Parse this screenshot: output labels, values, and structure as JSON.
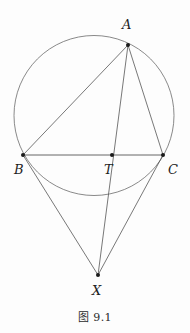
{
  "figure": {
    "caption": "图 9.1",
    "caption_number": "9.1",
    "background_color": "#fdfdfd",
    "stroke_color": "#555555",
    "vertex_color": "#1a1a1a",
    "label_color": "#1d1d1d",
    "stroke_width": 0.8,
    "vertex_radius": 2.0
  },
  "geometry": {
    "circle": {
      "name": "circumcircle",
      "cx": 94,
      "cy": 115.5,
      "r": 80,
      "stroke": "#6b6b6b"
    },
    "points": [
      {
        "id": "A",
        "label": "A",
        "x": 128,
        "y": 45,
        "label_x": 122,
        "label_y": 18
      },
      {
        "id": "B",
        "label": "B",
        "x": 23,
        "y": 155,
        "label_x": 14,
        "label_y": 163
      },
      {
        "id": "C",
        "label": "C",
        "x": 163,
        "y": 155,
        "label_x": 168,
        "label_y": 163
      },
      {
        "id": "T",
        "label": "T",
        "x": 112,
        "y": 155,
        "label_x": 104,
        "label_y": 163
      },
      {
        "id": "X",
        "label": "X",
        "x": 98,
        "y": 275,
        "label_x": 92,
        "label_y": 284
      }
    ],
    "segments": [
      {
        "id": "AB",
        "from": "A",
        "to": "B"
      },
      {
        "id": "AC",
        "from": "A",
        "to": "C"
      },
      {
        "id": "AX",
        "from": "A",
        "to": "X",
        "note": "passes through T"
      },
      {
        "id": "BC",
        "from": "B",
        "to": "C",
        "note": "passes through T"
      },
      {
        "id": "BX",
        "from": "B",
        "to": "X"
      },
      {
        "id": "CX",
        "from": "C",
        "to": "X"
      }
    ]
  }
}
